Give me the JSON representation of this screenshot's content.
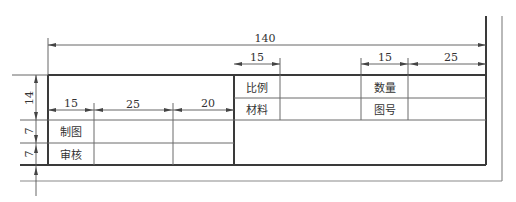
{
  "title_block": {
    "cells": {
      "scale_label": "比例",
      "material_label": "材料",
      "quantity_label": "数量",
      "drawing_no_label": "图号",
      "drawn_by_label": "制图",
      "checked_by_label": "审核"
    },
    "dimensions": {
      "overall_width": "140",
      "scale_col_width": "15",
      "quantity_col_width": "15",
      "quantity_value_width": "25",
      "col1_width": "15",
      "col2_width": "25",
      "col3_width": "20",
      "upper_height": "14",
      "row1_height": "7",
      "row2_height": "7"
    }
  }
}
